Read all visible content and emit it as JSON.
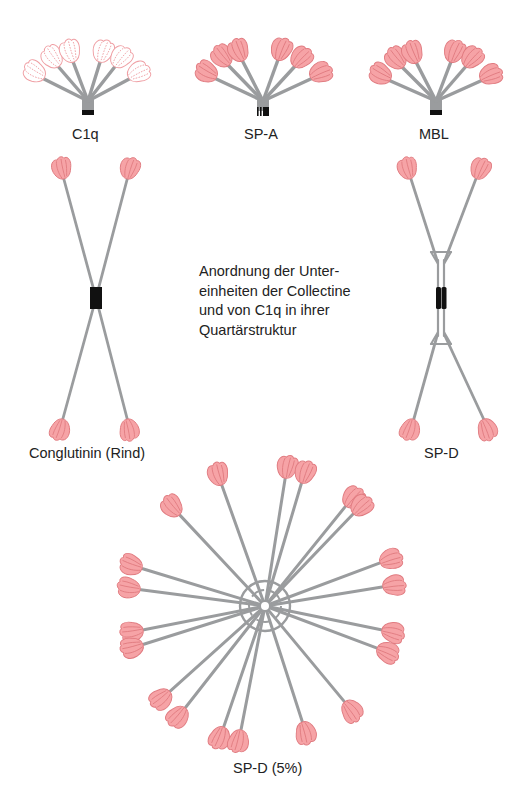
{
  "caption_lines": [
    "Anordnung der Unter-",
    "einheiten der Collectine",
    "und von C1q in ihrer",
    "Quartärstruktur"
  ],
  "colors": {
    "stalk": "#9a9c9e",
    "head_fill": "#f6a3a6",
    "head_stroke": "#e07b80",
    "head_outline_only_fill": "#ffffff",
    "core": "#111111"
  },
  "molecules": [
    {
      "id": "c1q",
      "label": "C1q",
      "arrangement": "bouquet",
      "subunits": 6,
      "head_style": "outlined"
    },
    {
      "id": "sp-a",
      "label": "SP-A",
      "arrangement": "bouquet",
      "subunits": 6,
      "head_style": "filled"
    },
    {
      "id": "mbl",
      "label": "MBL",
      "arrangement": "bouquet",
      "subunits": 6,
      "head_style": "filled"
    },
    {
      "id": "conglutinin",
      "label": "Conglutinin (Rind)",
      "arrangement": "cruciform",
      "subunits": 4,
      "head_style": "filled"
    },
    {
      "id": "sp-d",
      "label": "SP-D",
      "arrangement": "cruciform",
      "subunits": 4,
      "head_style": "filled"
    },
    {
      "id": "sp-d-multimer",
      "label": "SP-D (5%)",
      "arrangement": "radial multimer",
      "subunits": 24,
      "head_style": "filled"
    }
  ],
  "icons": {
    "head": "carbohydrate-recognition-domain-icon",
    "stalk": "collagen-stalk",
    "core": "n-terminal-core"
  }
}
